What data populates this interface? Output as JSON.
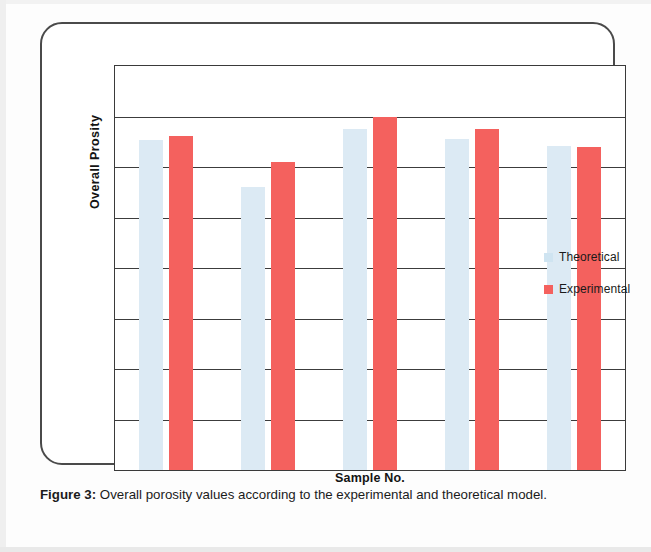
{
  "figure": {
    "caption_label": "Figure 3:",
    "caption_text": "Overall porosity values according to the experimental and theoretical model."
  },
  "legend": {
    "position": "inside-right",
    "entries": [
      {
        "label": "Theoretical",
        "color": "#cfe4f1"
      },
      {
        "label": "Experimental",
        "color": "#f4615e"
      }
    ]
  },
  "colors": {
    "theoretical": "#dceaf4",
    "experimental": "#f4615e",
    "axis": "#3a3a3a",
    "gridline": "#3c3c3c",
    "frame": "#4a4a4a",
    "text": "#1a1a1a",
    "background": "#ffffff"
  },
  "chart_data": {
    "type": "bar",
    "title": "",
    "subtitle": "",
    "xlabel": "Sample No.",
    "ylabel": "Overall  Prosity",
    "categories": [
      "1",
      "2",
      "3",
      "4",
      "5"
    ],
    "tick_labels": {
      "x": [],
      "y": []
    },
    "grid": true,
    "gridline_count": 8,
    "ylim": [
      0,
      1
    ],
    "series": [
      {
        "name": "Theoretical",
        "color": "#dceaf4",
        "values": [
          0.818,
          0.7,
          0.843,
          0.82,
          0.802
        ]
      },
      {
        "name": "Experimental",
        "color": "#f4615e",
        "values": [
          0.828,
          0.763,
          0.873,
          0.843,
          0.8
        ]
      }
    ],
    "annotations": []
  }
}
